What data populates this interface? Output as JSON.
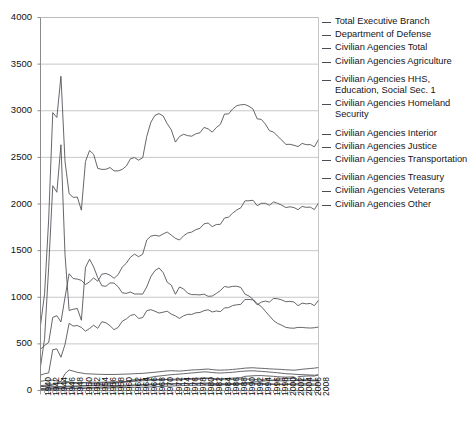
{
  "chart": {
    "type": "line",
    "title": "",
    "xlabel": "",
    "ylabel": "",
    "background": "#ffffff",
    "gridline_color": "#b9b9b9",
    "axis_color": "#8a8a8a",
    "line_color": "#4a4a52",
    "grid": "horizontal",
    "legend_position": "right"
  },
  "axes": {
    "y_ticks": [
      "4000",
      "3500",
      "3000",
      "2500",
      "2000",
      "1500",
      "1000",
      "500",
      "0"
    ],
    "y_min": 0,
    "y_max": 4000,
    "y_step": 500,
    "x_ticks": [
      "1940",
      "1942",
      "1944",
      "1946",
      "1948",
      "1950",
      "1952",
      "1954",
      "1956",
      "1958",
      "1960",
      "1962",
      "1964",
      "1966",
      "1968",
      "1970",
      "1972",
      "1974",
      "1976",
      "1978",
      "1980",
      "1982",
      "1984",
      "1986",
      "1988",
      "1990",
      "1992",
      "1994",
      "1996",
      "1998",
      "2000",
      "2002",
      "2004",
      "2006",
      "2008"
    ],
    "x_min": 1940,
    "x_max": 2008,
    "x_step": 2
  },
  "legend": {
    "groups": [
      {
        "items": [
          {
            "label": "Total Executive Branch"
          },
          {
            "label": "Department of Defense"
          },
          {
            "label": "Civilian Agencies Total"
          },
          {
            "label": "Civilian Agencies Agriculture"
          }
        ]
      },
      {
        "items": [
          {
            "label": "Civilian Agencies HHS,\nEducation, Social Sec. 1"
          },
          {
            "label": "Civilian Agencies Homeland\nSecurity"
          }
        ]
      },
      {
        "items": [
          {
            "label": "Civilian Agencies Interior"
          },
          {
            "label": "Civilian Agencies Justice"
          },
          {
            "label": "Civilian Agencies Transportation"
          }
        ]
      },
      {
        "items": [
          {
            "label": "Civilian Agencies Treasury"
          },
          {
            "label": "Civilian Agencies Veterans"
          },
          {
            "label": "Civilian Agencies Other"
          }
        ]
      }
    ]
  },
  "chart_data": {
    "type": "line",
    "title": "",
    "xlabel": "",
    "ylabel": "",
    "ylim": [
      0,
      4000
    ],
    "xlim": [
      1940,
      2008
    ],
    "grid": true,
    "legend_position": "right",
    "x": [
      1940,
      1941,
      1942,
      1943,
      1944,
      1945,
      1946,
      1947,
      1948,
      1949,
      1950,
      1951,
      1952,
      1953,
      1954,
      1955,
      1956,
      1957,
      1958,
      1959,
      1960,
      1961,
      1962,
      1963,
      1964,
      1965,
      1966,
      1967,
      1968,
      1969,
      1970,
      1971,
      1972,
      1973,
      1974,
      1975,
      1976,
      1977,
      1978,
      1979,
      1980,
      1981,
      1982,
      1983,
      1984,
      1985,
      1986,
      1987,
      1988,
      1989,
      1990,
      1991,
      1992,
      1993,
      1994,
      1995,
      1996,
      1997,
      1998,
      1999,
      2000,
      2001,
      2002,
      2003,
      2004,
      2005,
      2006,
      2007,
      2008
    ],
    "series": [
      {
        "name": "Total Executive Branch",
        "values": [
          699,
          1038,
          1838,
          2980,
          2928,
          3370,
          2455,
          2111,
          2071,
          2075,
          1934,
          2456,
          2574,
          2532,
          2382,
          2371,
          2372,
          2391,
          2355,
          2355,
          2371,
          2407,
          2485,
          2498,
          2470,
          2496,
          2726,
          2877,
          2951,
          2969,
          2944,
          2860,
          2795,
          2664,
          2724,
          2748,
          2733,
          2727,
          2753,
          2764,
          2821,
          2806,
          2770,
          2820,
          2854,
          2964,
          2966,
          3019,
          3054,
          3064,
          3067,
          3048,
          3017,
          2913,
          2908,
          2858,
          2786,
          2772,
          2727,
          2687,
          2639,
          2640,
          2630,
          2616,
          2650,
          2636,
          2637,
          2613,
          2692
        ]
      },
      {
        "name": "Department of Defense",
        "values": [
          256,
          556,
          1322,
          2196,
          2126,
          2635,
          1456,
          859,
          871,
          880,
          753,
          1320,
          1408,
          1325,
          1210,
          1124,
          1117,
          1154,
          1152,
          1112,
          1047,
          1042,
          1056,
          1035,
          1035,
          1034,
          1112,
          1222,
          1286,
          1314,
          1265,
          1161,
          1129,
          1032,
          1110,
          1089,
          1044,
          1028,
          1028,
          1025,
          1034,
          1010,
          1013,
          1040,
          1072,
          1115,
          1107,
          1117,
          1118,
          1105,
          1034,
          1013,
          977,
          931,
          901,
          850,
          800,
          750,
          720,
          700,
          677,
          670,
          668,
          677,
          676,
          672,
          670,
          673,
          681
        ]
      },
      {
        "name": "Civilian Agencies Total",
        "values": [
          443,
          482,
          516,
          784,
          802,
          735,
          999,
          1252,
          1200,
          1195,
          1181,
          1136,
          1166,
          1207,
          1172,
          1247,
          1255,
          1237,
          1203,
          1243,
          1324,
          1365,
          1429,
          1463,
          1435,
          1462,
          1614,
          1655,
          1665,
          1655,
          1679,
          1699,
          1666,
          1632,
          1614,
          1659,
          1689,
          1699,
          1725,
          1739,
          1787,
          1796,
          1757,
          1780,
          1782,
          1849,
          1859,
          1902,
          1936,
          1959,
          2033,
          2035,
          2040,
          1982,
          2007,
          2008,
          1986,
          2022,
          2007,
          1987,
          1962,
          1970,
          1962,
          1939,
          1974,
          1964,
          1967,
          1940,
          2011
        ]
      },
      {
        "name": "Civilian Agencies Agriculture",
        "values": [
          97,
          106,
          110,
          111,
          102,
          89,
          97,
          93,
          81,
          78,
          84,
          82,
          77,
          77,
          74,
          80,
          84,
          85,
          85,
          88,
          91,
          97,
          110,
          116,
          115,
          116,
          122,
          118,
          115,
          117,
          121,
          117,
          113,
          113,
          114,
          118,
          119,
          120,
          120,
          122,
          129,
          131,
          121,
          118,
          117,
          116,
          114,
          119,
          122,
          122,
          123,
          121,
          119,
          116,
          115,
          113,
          110,
          107,
          104,
          103,
          104,
          106,
          107,
          108,
          109,
          107,
          105,
          103,
          105
        ]
      },
      {
        "name": "Civilian Agencies HHS, Education, Social Sec. 1",
        "values": [
          20,
          23,
          27,
          30,
          32,
          34,
          39,
          42,
          45,
          48,
          51,
          52,
          54,
          57,
          60,
          64,
          68,
          72,
          77,
          82,
          86,
          92,
          98,
          105,
          112,
          120,
          131,
          142,
          150,
          155,
          160,
          165,
          170,
          173,
          176,
          180,
          184,
          188,
          192,
          196,
          200,
          198,
          193,
          189,
          187,
          190,
          192,
          196,
          200,
          205,
          208,
          210,
          211,
          208,
          205,
          202,
          198,
          194,
          190,
          185,
          180,
          178,
          175,
          172,
          170,
          168,
          166,
          164,
          165
        ]
      },
      {
        "name": "Civilian Agencies Homeland Security",
        "values": [
          0,
          0,
          0,
          0,
          0,
          0,
          0,
          0,
          0,
          0,
          0,
          0,
          0,
          0,
          0,
          0,
          0,
          0,
          0,
          0,
          0,
          0,
          0,
          0,
          0,
          0,
          0,
          0,
          0,
          0,
          0,
          0,
          0,
          0,
          0,
          0,
          0,
          0,
          0,
          0,
          0,
          0,
          0,
          0,
          0,
          0,
          0,
          0,
          0,
          0,
          0,
          0,
          0,
          0,
          0,
          0,
          0,
          0,
          0,
          0,
          0,
          0,
          0,
          148,
          152,
          155,
          156,
          154,
          171
        ]
      },
      {
        "name": "Civilian Agencies Interior",
        "values": [
          42,
          45,
          48,
          44,
          42,
          43,
          46,
          47,
          45,
          46,
          48,
          49,
          50,
          51,
          50,
          51,
          52,
          53,
          53,
          54,
          55,
          56,
          58,
          60,
          62,
          64,
          66,
          68,
          70,
          71,
          72,
          72,
          72,
          71,
          73,
          75,
          76,
          76,
          77,
          78,
          80,
          80,
          76,
          74,
          73,
          74,
          74,
          75,
          76,
          77,
          80,
          78,
          77,
          76,
          75,
          74,
          72,
          70,
          69,
          68,
          69,
          70,
          71,
          72,
          72,
          71,
          70,
          69,
          70
        ]
      },
      {
        "name": "Civilian Agencies Justice",
        "values": [
          13,
          14,
          16,
          17,
          17,
          18,
          19,
          20,
          20,
          21,
          22,
          23,
          24,
          25,
          25,
          26,
          27,
          28,
          29,
          30,
          31,
          32,
          33,
          34,
          35,
          36,
          37,
          38,
          40,
          42,
          44,
          46,
          48,
          50,
          52,
          53,
          54,
          55,
          56,
          56,
          57,
          57,
          57,
          58,
          60,
          62,
          64,
          66,
          68,
          72,
          80,
          85,
          90,
          95,
          100,
          103,
          108,
          112,
          120,
          125,
          128,
          130,
          131,
          103,
          105,
          106,
          107,
          108,
          110
        ]
      },
      {
        "name": "Civilian Agencies Transportation",
        "values": [
          12,
          14,
          16,
          18,
          19,
          20,
          22,
          24,
          25,
          26,
          27,
          28,
          30,
          32,
          34,
          36,
          38,
          40,
          42,
          44,
          46,
          48,
          50,
          52,
          54,
          56,
          58,
          60,
          62,
          66,
          70,
          71,
          72,
          73,
          74,
          74,
          75,
          75,
          75,
          74,
          73,
          72,
          66,
          62,
          62,
          63,
          64,
          65,
          66,
          67,
          68,
          68,
          69,
          68,
          66,
          64,
          63,
          64,
          64,
          63,
          64,
          65,
          65,
          59,
          58,
          57,
          56,
          55,
          55
        ]
      },
      {
        "name": "Civilian Agencies Treasury",
        "values": [
          52,
          56,
          62,
          68,
          72,
          76,
          82,
          86,
          85,
          84,
          85,
          86,
          88,
          89,
          88,
          89,
          90,
          92,
          93,
          94,
          95,
          96,
          98,
          100,
          102,
          104,
          108,
          110,
          112,
          114,
          116,
          118,
          120,
          122,
          124,
          126,
          128,
          129,
          130,
          132,
          134,
          132,
          128,
          126,
          127,
          129,
          130,
          132,
          135,
          138,
          152,
          155,
          158,
          160,
          160,
          157,
          155,
          152,
          148,
          145,
          143,
          145,
          146,
          115,
          115,
          114,
          113,
          111,
          112
        ]
      },
      {
        "name": "Civilian Agencies Veterans",
        "values": [
          42,
          44,
          48,
          58,
          72,
          98,
          180,
          220,
          208,
          195,
          188,
          180,
          178,
          176,
          174,
          173,
          172,
          172,
          172,
          173,
          175,
          176,
          178,
          180,
          182,
          184,
          188,
          192,
          196,
          200,
          206,
          210,
          212,
          210,
          208,
          212,
          216,
          220,
          222,
          224,
          228,
          230,
          224,
          220,
          218,
          220,
          222,
          226,
          230,
          234,
          240,
          242,
          244,
          240,
          238,
          236,
          232,
          230,
          228,
          226,
          222,
          220,
          218,
          222,
          228,
          232,
          236,
          240,
          246
        ]
      },
      {
        "name": "Civilian Agencies Other",
        "values": [
          165,
          180,
          189,
          438,
          446,
          357,
          494,
          720,
          691,
          697,
          676,
          636,
          665,
          700,
          667,
          738,
          726,
          695,
          652,
          677,
          743,
          768,
          804,
          816,
          773,
          782,
          856,
          867,
          850,
          830,
          840,
          850,
          819,
          800,
          773,
          801,
          817,
          816,
          833,
          837,
          856,
          866,
          842,
          853,
          846,
          885,
          889,
          911,
          919,
          924,
          976,
          976,
          972,
          919,
          948,
          959,
          948,
          988,
          984,
          972,
          952,
          956,
          949,
          909,
          937,
          929,
          934,
          910,
          967
        ]
      }
    ]
  }
}
